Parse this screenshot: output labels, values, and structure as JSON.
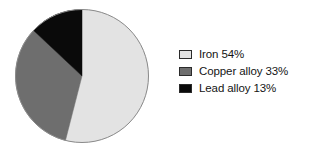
{
  "figure": {
    "background_color": "#ffffff",
    "width": 324,
    "height": 151
  },
  "legend": {
    "position": "right",
    "items": [
      {
        "label": "Iron 54%",
        "name": "Iron",
        "value": 54,
        "color": "#e3e3e3",
        "swatch_border": "#2b2b2b"
      },
      {
        "label": "Copper alloy 33%",
        "name": "Copper alloy",
        "value": 33,
        "color": "#6e6e6e",
        "swatch_border": "#2b2b2b"
      },
      {
        "label": "Lead alloy 13%",
        "name": "Lead alloy",
        "value": 13,
        "color": "#0a0a0a",
        "swatch_border": "#2b2b2b"
      }
    ]
  },
  "pie": {
    "center_x": 68,
    "center_y": 68,
    "radius": 66.5,
    "start_angle_deg": 0,
    "direction": "clockwise",
    "outline_color": "#8a8a8a",
    "outline_width": 1
  },
  "chart_data": {
    "type": "pie",
    "title": "",
    "labels": [
      "Iron",
      "Copper alloy",
      "Lead alloy"
    ],
    "values": [
      54,
      33,
      13
    ],
    "units": "%",
    "colors": [
      "#e3e3e3",
      "#6e6e6e",
      "#0a0a0a"
    ],
    "data_labels": [
      "Iron 54%",
      "Copper alloy 33%",
      "Lead alloy 13%"
    ],
    "legend_position": "right",
    "grid": false,
    "total": 100
  }
}
